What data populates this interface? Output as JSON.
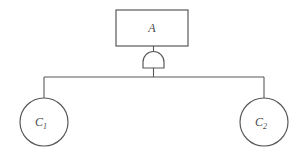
{
  "diagram": {
    "type": "fault-tree",
    "background_color": "#ffffff",
    "stroke_color": "#595959",
    "label_color": "#4a4a4a",
    "stroke_width": 1,
    "nodes": {
      "top_event": {
        "shape": "rectangle",
        "label": "A",
        "x": 116,
        "y": 10,
        "width": 72,
        "height": 36,
        "label_x": 152,
        "label_y": 28
      },
      "gate": {
        "shape": "and-gate",
        "kind": "AND",
        "center_x": 153.5,
        "base_y": 68,
        "top_y": 57,
        "half_width": 10.5
      },
      "basic_event_1": {
        "shape": "circle",
        "label": "C",
        "subscript": "1",
        "center_x": 44,
        "center_y": 122,
        "radius": 24
      },
      "basic_event_2": {
        "shape": "circle",
        "label": "C",
        "subscript": "2",
        "center_x": 264,
        "center_y": 122,
        "radius": 24
      }
    },
    "connectors": {
      "rect_to_gate": {
        "x": 153.5,
        "y1": 46,
        "y2": 57
      },
      "gate_to_bar": {
        "x": 153.5,
        "y1": 68,
        "y2": 77
      },
      "horizontal_bar": {
        "y": 77,
        "x1": 44,
        "x2": 264
      },
      "bar_to_event_1": {
        "x": 44,
        "y1": 77,
        "y2": 98
      },
      "bar_to_event_2": {
        "x": 264,
        "y1": 77,
        "y2": 98
      }
    }
  }
}
